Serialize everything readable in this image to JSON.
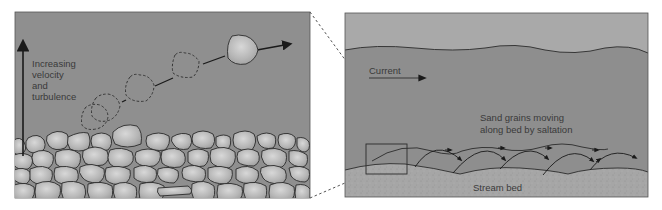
{
  "left_panel": {
    "title": "Bedload cobble saltation detail",
    "label_lines": [
      "Increasing",
      "velocity",
      "and",
      "turbulence"
    ],
    "arrow": "up-arrow",
    "background": "#8f8f8f",
    "stone_fill": "#b8b8b8",
    "stone_stroke": "#2b2b2b"
  },
  "right_panel": {
    "current_label": "Current",
    "saltation_label_lines": [
      "Sand grains moving",
      "along bed by saltation"
    ],
    "bed_label": "Stream bed",
    "sky_color": "#a9a9a9",
    "water_color": "#8e8e8e",
    "bed_color": "#a4a4a4"
  },
  "connector": {
    "style": "dashed",
    "color": "#555555"
  }
}
